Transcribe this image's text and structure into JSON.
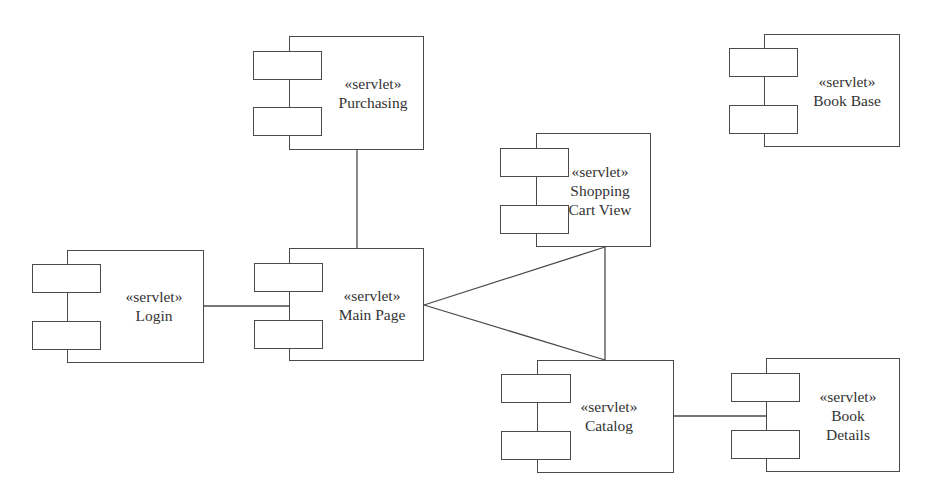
{
  "diagram": {
    "type": "UML component diagram",
    "stroke_color": "#4a4a4a",
    "background": "#ffffff",
    "components": [
      {
        "id": "purchasing",
        "stereotype": "«servlet»",
        "name_lines": [
          "Purchasing"
        ],
        "body": {
          "x": 289,
          "y": 36,
          "w": 135,
          "h": 114
        },
        "ports": [
          {
            "x": 253,
            "y": 51,
            "w": 69,
            "h": 29
          },
          {
            "x": 253,
            "y": 107,
            "w": 69,
            "h": 29
          }
        ],
        "label_center": {
          "x": 373,
          "y": 93
        }
      },
      {
        "id": "login",
        "stereotype": "«servlet»",
        "name_lines": [
          "Login"
        ],
        "body": {
          "x": 67,
          "y": 250,
          "w": 137,
          "h": 113
        },
        "ports": [
          {
            "x": 32,
            "y": 264,
            "w": 69,
            "h": 29
          },
          {
            "x": 32,
            "y": 321,
            "w": 69,
            "h": 29
          }
        ],
        "label_center": {
          "x": 154,
          "y": 306
        }
      },
      {
        "id": "main-page",
        "stereotype": "«servlet»",
        "name_lines": [
          "Main Page"
        ],
        "body": {
          "x": 289,
          "y": 248,
          "w": 135,
          "h": 113
        },
        "ports": [
          {
            "x": 254,
            "y": 263,
            "w": 69,
            "h": 29
          },
          {
            "x": 254,
            "y": 320,
            "w": 69,
            "h": 29
          }
        ],
        "label_center": {
          "x": 372,
          "y": 305
        }
      },
      {
        "id": "shopping-cart-view",
        "stereotype": "«servlet»",
        "name_lines": [
          "Shopping",
          "Cart View"
        ],
        "body": {
          "x": 536,
          "y": 133,
          "w": 115,
          "h": 114
        },
        "ports": [
          {
            "x": 500,
            "y": 148,
            "w": 69,
            "h": 29
          },
          {
            "x": 500,
            "y": 205,
            "w": 69,
            "h": 29
          }
        ],
        "label_center": {
          "x": 600,
          "y": 190
        }
      },
      {
        "id": "catalog",
        "stereotype": "«servlet»",
        "name_lines": [
          "Catalog"
        ],
        "body": {
          "x": 537,
          "y": 360,
          "w": 137,
          "h": 113
        },
        "ports": [
          {
            "x": 501,
            "y": 374,
            "w": 70,
            "h": 29
          },
          {
            "x": 501,
            "y": 431,
            "w": 70,
            "h": 29
          }
        ],
        "label_center": {
          "x": 609,
          "y": 416
        }
      },
      {
        "id": "book-details",
        "stereotype": "«servlet»",
        "name_lines": [
          "Book",
          "Details"
        ],
        "body": {
          "x": 766,
          "y": 358,
          "w": 134,
          "h": 114
        },
        "ports": [
          {
            "x": 731,
            "y": 373,
            "w": 69,
            "h": 29
          },
          {
            "x": 731,
            "y": 430,
            "w": 69,
            "h": 29
          }
        ],
        "label_center": {
          "x": 848,
          "y": 415
        }
      },
      {
        "id": "book-base",
        "stereotype": "«servlet»",
        "name_lines": [
          "Book Base"
        ],
        "body": {
          "x": 764,
          "y": 34,
          "w": 136,
          "h": 113
        },
        "ports": [
          {
            "x": 729,
            "y": 48,
            "w": 69,
            "h": 29
          },
          {
            "x": 729,
            "y": 105,
            "w": 69,
            "h": 29
          }
        ],
        "label_center": {
          "x": 847,
          "y": 91
        }
      }
    ],
    "connectors": [
      {
        "from": "purchasing",
        "to": "main-page",
        "points": [
          [
            357,
            150
          ],
          [
            357,
            248
          ]
        ]
      },
      {
        "from": "login",
        "to": "main-page",
        "points": [
          [
            204,
            306
          ],
          [
            289,
            306
          ]
        ]
      },
      {
        "from": "main-page",
        "to": "shopping-cart-view",
        "points": [
          [
            424,
            305
          ],
          [
            605,
            247
          ]
        ]
      },
      {
        "from": "main-page",
        "to": "catalog",
        "points": [
          [
            424,
            305
          ],
          [
            605,
            360
          ]
        ]
      },
      {
        "from": "shopping-cart-view",
        "to": "catalog",
        "points": [
          [
            605,
            247
          ],
          [
            605,
            360
          ]
        ]
      },
      {
        "from": "catalog",
        "to": "book-details",
        "points": [
          [
            674,
            416
          ],
          [
            766,
            416
          ]
        ]
      }
    ]
  }
}
